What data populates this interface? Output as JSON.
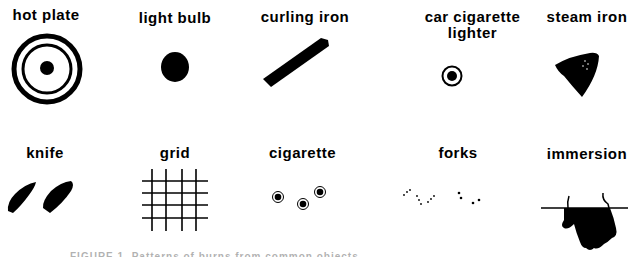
{
  "figure": {
    "items": [
      {
        "label": "hot plate",
        "icon": "concentric-rings-icon"
      },
      {
        "label": "light bulb",
        "icon": "filled-dot-icon"
      },
      {
        "label": "curling iron",
        "icon": "diagonal-bar-icon"
      },
      {
        "label_line1": "car cigarette",
        "label_line2": "lighter",
        "icon": "ringed-dot-icon"
      },
      {
        "label": "steam iron",
        "icon": "iron-shape-icon"
      },
      {
        "label": "knife",
        "icon": "knife-blades-icon"
      },
      {
        "label": "grid",
        "icon": "grid-lines-icon"
      },
      {
        "label": "cigarette",
        "icon": "three-ringed-dots-icon"
      },
      {
        "label": "forks",
        "icon": "dot-clusters-icon"
      },
      {
        "label": "immersion",
        "icon": "immersed-hand-icon"
      }
    ],
    "caption": "FIGURE 1. Patterns of burns from common objects"
  }
}
